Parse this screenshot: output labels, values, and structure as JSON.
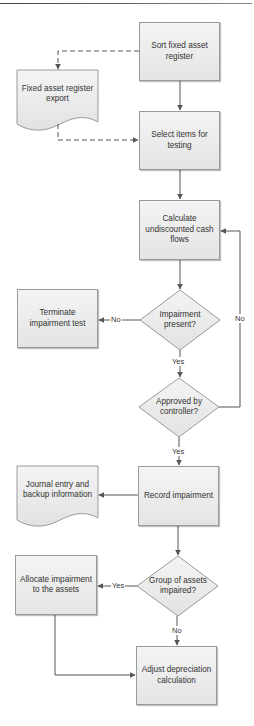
{
  "colors": {
    "box_fill_top": "#f4f4f4",
    "box_fill_bottom": "#e4e4e4",
    "border": "#9a9a9a",
    "connector": "#555555",
    "text": "#333333"
  },
  "nodes": {
    "sort_register": {
      "type": "process",
      "label": "Sort fixed asset register"
    },
    "register_export": {
      "type": "document",
      "label": "Fixed asset register export"
    },
    "select_items": {
      "type": "process",
      "label": "Select items for testing"
    },
    "calc_cash_flows": {
      "type": "process",
      "label": "Calculate undiscounted cash flows"
    },
    "impairment_present": {
      "type": "decision",
      "label": "Impairment present?"
    },
    "terminate_test": {
      "type": "process",
      "label": "Terminate impairment test"
    },
    "approved_controller": {
      "type": "decision",
      "label": "Approved by controller?"
    },
    "record_impairment": {
      "type": "process",
      "label": "Record impairment"
    },
    "journal_entry": {
      "type": "document",
      "label": "Journal entry and backup information"
    },
    "group_impaired": {
      "type": "decision",
      "label": "Group of assets impaired?"
    },
    "allocate_impairment": {
      "type": "process",
      "label": "Allocate impairment to the assets"
    },
    "adjust_depreciation": {
      "type": "process",
      "label": "Adjust depreciation calculation"
    }
  },
  "edges": {
    "impairment_no": "No",
    "impairment_yes": "Yes",
    "approved_no": "No",
    "approved_yes": "Yes",
    "group_yes": "Yes",
    "group_no": "No"
  }
}
